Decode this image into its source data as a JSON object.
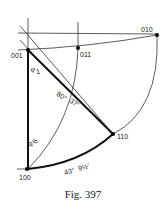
{
  "figure": {
    "caption": "Fig. 397",
    "points": [
      {
        "label": "001",
        "x": 28,
        "y": 50
      },
      {
        "label": "011",
        "x": 78,
        "y": 48
      },
      {
        "label": "010",
        "x": 157,
        "y": 35
      },
      {
        "label": "110",
        "x": 113,
        "y": 134
      },
      {
        "label": "100",
        "x": 27,
        "y": 169
      }
    ],
    "angle_labels": {
      "phi1": "φ",
      "phi1_sub": "1",
      "phi6": "φ",
      "phi6_sub": "6",
      "a80": "80°",
      "a37": "37′",
      "arc_deg": "43°",
      "arc_min": "9½′"
    },
    "colors": {
      "line": "#1a1a1a",
      "background": "#ffffff"
    }
  }
}
